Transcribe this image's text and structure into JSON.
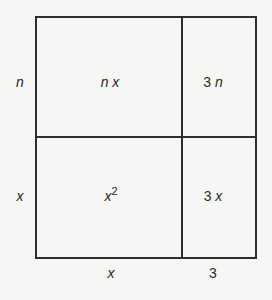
{
  "diagram": {
    "type": "area-model",
    "side_labels": {
      "left_top": "n",
      "left_bottom": "x",
      "bottom_left": "x",
      "bottom_right": "3"
    },
    "cells": {
      "top_left": {
        "coef": "",
        "var": "n x",
        "exp": ""
      },
      "top_right": {
        "coef": "3 ",
        "var": "n",
        "exp": ""
      },
      "bottom_left": {
        "coef": "",
        "var": "x",
        "exp": "2"
      },
      "bottom_right": {
        "coef": "3 ",
        "var": "x",
        "exp": ""
      }
    },
    "colors": {
      "line": "#2e2e2e",
      "background": "#f6f6f4",
      "text": "#2a2a2a"
    }
  }
}
